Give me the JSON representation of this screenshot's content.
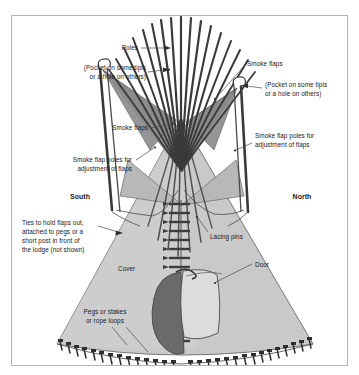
{
  "figure": {
    "border_color": "#b4b4b4",
    "background": "#ffffff"
  },
  "colors": {
    "cover_fill": "#c9c9c9",
    "cover_stroke": "#5a5a5a",
    "flap_fill": "#9a9a9a",
    "flap_fill_dark": "#8a8a8a",
    "pole_color": "#3a3a3a",
    "door_opening": "#6a6a6a",
    "door_flap": "#dcdcdc",
    "lacing_pin": "#3c3c3c",
    "leader_line": "#4a4a4a",
    "text": "#1b1b1b"
  },
  "labels": {
    "poles": "Poles",
    "pocket_left_line1": "(Pocket on some tipis",
    "pocket_left_line2": "or a hole on others)",
    "pocket_right_line1": "(Pocket on some tipis",
    "pocket_right_line2": "or a hole on others)",
    "smoke_flaps_top": "Smoke flaps",
    "smoke_flaps_left": "Smoke flaps",
    "flap_poles_left_line1": "Smoke flap poles for",
    "flap_poles_left_line2": "adjustment of flaps",
    "flap_poles_right_line1": "Smoke flap poles for",
    "flap_poles_right_line2": "adjustment of flaps",
    "south": "South",
    "north": "North",
    "ties_line1": "Ties to hold flaps out,",
    "ties_line2": "attached to pegs or a",
    "ties_line3": "short post in front of",
    "ties_line4": "the lodge (not shown)",
    "lacing_pins": "Lacing pins",
    "cover": "Cover",
    "door": "Door",
    "pegs_line1": "Pegs or stakes",
    "pegs_line2": "or rope loops"
  },
  "diagram_data": {
    "type": "diagram",
    "subject": "Plains tipi — labeled parts",
    "orientation": {
      "left_side": "South",
      "right_side": "North"
    },
    "pole_count": 17,
    "lacing_pin_count": 10,
    "ground_peg_count": 34,
    "parts": [
      "Poles",
      "Smoke flaps",
      "Smoke flap poles for adjustment of flaps",
      "Pocket on some tipis or a hole on others",
      "Ties to hold flaps out, attached to pegs or a short post in front of the lodge (not shown)",
      "Lacing pins",
      "Cover",
      "Door",
      "Pegs or stakes or rope loops"
    ]
  }
}
